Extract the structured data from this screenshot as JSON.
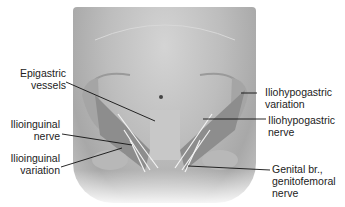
{
  "figure": {
    "colors": {
      "background": "#ffffff",
      "skin": "#bdbdbd",
      "muscle": "#8a8a8a",
      "nerve": "#f2f2f2",
      "leader_line": "#111111",
      "text": "#222222"
    },
    "labels": {
      "epigastric_vessels": [
        "Epigastric",
        "vessels"
      ],
      "ilioinguinal_nerve": [
        "Ilioinguinal",
        "nerve"
      ],
      "ilioinguinal_variation": [
        "Ilioinguinal",
        "variation"
      ],
      "iliohypogastric_variation": [
        "Iliohypogastric",
        "variation"
      ],
      "iliohypogastric_nerve": [
        "Iliohypogastric",
        "nerve"
      ],
      "genital_branch": [
        "Genital br.,",
        "genitofemoral",
        "nerve"
      ]
    }
  }
}
